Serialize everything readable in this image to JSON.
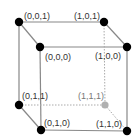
{
  "diagram": {
    "type": "unit-cube",
    "colors": {
      "edge": "#888888",
      "hidden_edge": "#aaaaaa",
      "vertex": "#000000",
      "hidden_vertex": "#b0b0b0",
      "label": "#333333",
      "hidden_label": "#777777"
    },
    "vertices": [
      {
        "id": "v001",
        "label": "(0,0,1)",
        "x": 19,
        "y": 22,
        "lx": 24,
        "ly": 19,
        "hidden": false
      },
      {
        "id": "v101",
        "label": "(1,0,1)",
        "x": 104,
        "y": 22,
        "lx": 74,
        "ly": 19,
        "hidden": false
      },
      {
        "id": "v000",
        "label": "(0,0,0)",
        "x": 40,
        "y": 47,
        "lx": 45,
        "ly": 60,
        "hidden": false
      },
      {
        "id": "v100",
        "label": "(1,0,0)",
        "x": 127,
        "y": 47,
        "lx": 95,
        "ly": 59,
        "hidden": false
      },
      {
        "id": "v011",
        "label": "(0,1,1)",
        "x": 19,
        "y": 105,
        "lx": 22,
        "ly": 99,
        "hidden": false
      },
      {
        "id": "v111",
        "label": "(1,1,1)",
        "x": 105,
        "y": 105,
        "lx": 78,
        "ly": 99,
        "hidden": true
      },
      {
        "id": "v010",
        "label": "(0,1,0)",
        "x": 41,
        "y": 130,
        "lx": 44,
        "ly": 126,
        "hidden": false
      },
      {
        "id": "v110",
        "label": "(1,1,0)",
        "x": 127,
        "y": 131,
        "lx": 96,
        "ly": 127,
        "hidden": false
      }
    ],
    "edges": [
      {
        "from": "v001",
        "to": "v101",
        "hidden": false
      },
      {
        "from": "v001",
        "to": "v000",
        "hidden": false
      },
      {
        "from": "v101",
        "to": "v100",
        "hidden": false
      },
      {
        "from": "v000",
        "to": "v100",
        "hidden": false
      },
      {
        "from": "v001",
        "to": "v011",
        "hidden": false
      },
      {
        "from": "v000",
        "to": "v010",
        "hidden": false
      },
      {
        "from": "v100",
        "to": "v110",
        "hidden": false
      },
      {
        "from": "v011",
        "to": "v010",
        "hidden": false
      },
      {
        "from": "v010",
        "to": "v110",
        "hidden": false
      },
      {
        "from": "v101",
        "to": "v111",
        "hidden": true
      },
      {
        "from": "v011",
        "to": "v111",
        "hidden": true
      },
      {
        "from": "v111",
        "to": "v110",
        "hidden": true
      }
    ]
  }
}
